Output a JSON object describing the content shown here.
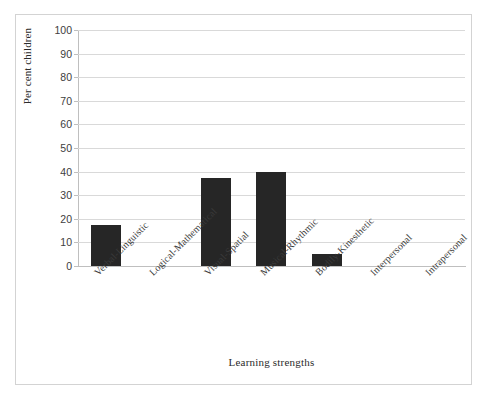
{
  "chart_data": {
    "type": "bar",
    "title": "",
    "xlabel": "Learning strengths",
    "ylabel": "Per cent children",
    "categories": [
      "Verbal-Linguistic",
      "Logical-Mathematical",
      "Visual-Spatial",
      "Musical-Rhythmic",
      "Bodily-Kinesthetic",
      "Interpersonal",
      "Intrapersonal"
    ],
    "values": [
      17.5,
      0,
      37.5,
      40,
      5,
      0,
      0
    ],
    "ylim": [
      0,
      100
    ],
    "yticks": [
      0,
      10,
      20,
      30,
      40,
      50,
      60,
      70,
      80,
      90,
      100
    ],
    "ytick_labels": [
      "0",
      "10",
      "20",
      "30",
      "40",
      "50",
      "60",
      "70",
      "80",
      "90",
      "100"
    ],
    "grid": true,
    "legend": "none",
    "bar_color": "#262626",
    "gridline_color": "#d9d9d9",
    "frame_color": "#d3d3d3"
  }
}
